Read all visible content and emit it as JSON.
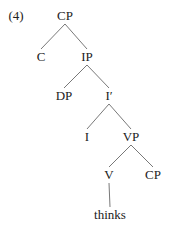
{
  "example_number": "(4)",
  "tree": {
    "nodes": [
      {
        "id": "cp1",
        "label": "CP",
        "x": 65,
        "y": 16
      },
      {
        "id": "c",
        "label": "C",
        "x": 41,
        "y": 57
      },
      {
        "id": "ip",
        "label": "IP",
        "x": 87,
        "y": 57
      },
      {
        "id": "dp",
        "label": "DP",
        "x": 64,
        "y": 96
      },
      {
        "id": "ibar",
        "label": "I′",
        "x": 109,
        "y": 96
      },
      {
        "id": "i",
        "label": "I",
        "x": 87,
        "y": 137
      },
      {
        "id": "vp",
        "label": "VP",
        "x": 131,
        "y": 137
      },
      {
        "id": "v",
        "label": "V",
        "x": 109,
        "y": 175
      },
      {
        "id": "cp2",
        "label": "CP",
        "x": 153,
        "y": 175
      },
      {
        "id": "thinks",
        "label": "thinks",
        "x": 110,
        "y": 215
      }
    ],
    "edges": [
      [
        "cp1",
        "c"
      ],
      [
        "cp1",
        "ip"
      ],
      [
        "ip",
        "dp"
      ],
      [
        "ip",
        "ibar"
      ],
      [
        "ibar",
        "i"
      ],
      [
        "ibar",
        "vp"
      ],
      [
        "vp",
        "v"
      ],
      [
        "vp",
        "cp2"
      ],
      [
        "v",
        "thinks"
      ]
    ]
  }
}
